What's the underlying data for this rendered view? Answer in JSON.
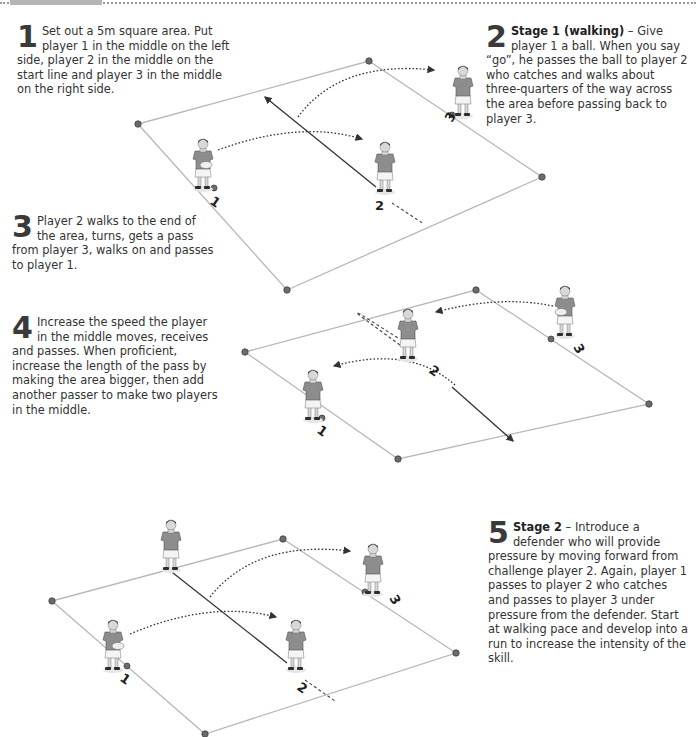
{
  "header": {
    "rule_style": "dotted",
    "tab_color": "#b5b5b5"
  },
  "steps": [
    {
      "number": "1",
      "lead": "",
      "text": "Set out a 5m square area. Put player 1 in the middle on the left side, player 2 in the middle on the start line and player 3 in the middle on the right side."
    },
    {
      "number": "2",
      "lead": "Stage 1 (walking)",
      "text": " – Give player 1 a ball. When you say “go”, he passes the ball to player 2 who catches and walks about three-quarters of the way across the area before passing back to player 3."
    },
    {
      "number": "3",
      "lead": "",
      "text": "Player 2 walks to the end of the area, turns, gets a pass from player 3, walks on and passes to player 1."
    },
    {
      "number": "4",
      "lead": "",
      "text": "Increase the speed the player in the middle moves, receives and passes. When proficient, increase the length of the pass by making the area bigger, then add another passer to make two players in the middle."
    },
    {
      "number": "5",
      "lead": "Stage 2",
      "text": " – Introduce a defender who will provide pressure by moving forward from challenge player 2. Again, player 1 passes to player 2 who catches and passes to player 3 under pressure from the defender. Start at walking pace and develop into a run to increase the intensity of the skill."
    }
  ],
  "diagrams": [
    {
      "name": "diagram-stage-1-pass-to-player-2",
      "player_labels": [
        "1",
        "2",
        "3"
      ]
    },
    {
      "name": "diagram-stage-1-return-to-player-1",
      "player_labels": [
        "1",
        "2",
        "3"
      ]
    },
    {
      "name": "diagram-stage-2-with-defender",
      "player_labels": [
        "1",
        "2",
        "3"
      ]
    }
  ],
  "colors": {
    "text": "#333333",
    "boundary": "#b8b8b8",
    "cone": "#6b6b6b",
    "shirt": "#8d8d8d"
  }
}
